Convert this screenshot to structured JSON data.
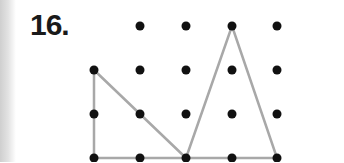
{
  "problem": {
    "number_label": "16."
  },
  "grid": {
    "columns_x": [
      94,
      140,
      186,
      232,
      277
    ],
    "rows_y": [
      26,
      70,
      114,
      158
    ],
    "dot_radius": 4.5,
    "dot_color": "#111111",
    "omitted_dots": [
      [
        0,
        0
      ]
    ]
  },
  "shapes": [
    {
      "name": "right-triangle",
      "vertices": [
        [
          94,
          70
        ],
        [
          94,
          158
        ],
        [
          186,
          158
        ]
      ],
      "stroke": "#a8a8a8"
    },
    {
      "name": "isosceles-triangle",
      "vertices": [
        [
          232,
          26
        ],
        [
          186,
          158
        ],
        [
          277,
          158
        ]
      ],
      "stroke": "#a8a8a8"
    }
  ]
}
